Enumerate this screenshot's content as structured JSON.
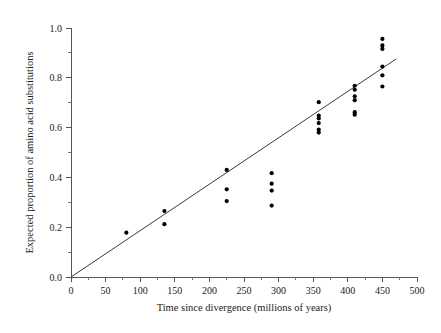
{
  "chart_data": {
    "type": "scatter",
    "title": "",
    "xlabel": "Time since divergence (millions of years)",
    "ylabel": "Expected proportion of amino acid substitutions",
    "xlim": [
      0,
      500
    ],
    "ylim": [
      0.0,
      1.0
    ],
    "grid": false,
    "legend": null,
    "x_ticks": [
      0,
      50,
      100,
      150,
      200,
      250,
      300,
      350,
      400,
      450,
      500
    ],
    "x_ticklabels": [
      "0",
      "50",
      "100",
      "150",
      "200",
      "250",
      "300",
      "350",
      "400",
      "450",
      "500"
    ],
    "x_minor_step": 25,
    "y_ticks": [
      0.0,
      0.2,
      0.4,
      0.6,
      0.8,
      1.0
    ],
    "y_ticklabels": [
      "0.0",
      "0.2",
      "0.4",
      "0.6",
      "0.8",
      "1.0"
    ],
    "y_minor_step": 0.1,
    "marker": "filled-circle",
    "marker_color": "#000000",
    "marker_size_px": 4.2,
    "series": [
      {
        "name": "Amino acid substitutions vs divergence time",
        "points": [
          [
            80,
            0.178
          ],
          [
            135,
            0.265
          ],
          [
            135,
            0.212
          ],
          [
            225,
            0.43
          ],
          [
            225,
            0.352
          ],
          [
            225,
            0.305
          ],
          [
            290,
            0.417
          ],
          [
            290,
            0.375
          ],
          [
            290,
            0.347
          ],
          [
            290,
            0.287
          ],
          [
            358,
            0.702
          ],
          [
            358,
            0.648
          ],
          [
            358,
            0.637
          ],
          [
            358,
            0.618
          ],
          [
            358,
            0.592
          ],
          [
            358,
            0.58
          ],
          [
            410,
            0.768
          ],
          [
            410,
            0.752
          ],
          [
            410,
            0.726
          ],
          [
            410,
            0.71
          ],
          [
            410,
            0.662
          ],
          [
            410,
            0.652
          ],
          [
            450,
            0.956
          ],
          [
            450,
            0.93
          ],
          [
            450,
            0.916
          ],
          [
            450,
            0.845
          ],
          [
            450,
            0.81
          ],
          [
            450,
            0.765
          ]
        ]
      }
    ],
    "fit_line": {
      "type": "linear-regression",
      "through_origin": true,
      "x_start": 0,
      "y_start": 0.0,
      "x_end": 470,
      "y_end": 0.876
    }
  }
}
